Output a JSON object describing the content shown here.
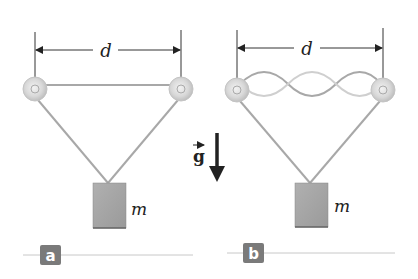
{
  "figure": {
    "gravity_label": "g",
    "colors": {
      "string": "#a8a8a8",
      "mass": "#a0a0a0",
      "pulley": "#d4d4d4",
      "badge": "#7a7a7a",
      "baseline": "#c8c8c8",
      "arrow": "#222222"
    }
  },
  "panels": [
    {
      "id": "a",
      "badge": "a",
      "distance_label": "d",
      "mass_label": "m",
      "string_state": "straight"
    },
    {
      "id": "b",
      "badge": "b",
      "distance_label": "d",
      "mass_label": "m",
      "string_state": "standing wave (3 loops)"
    }
  ]
}
